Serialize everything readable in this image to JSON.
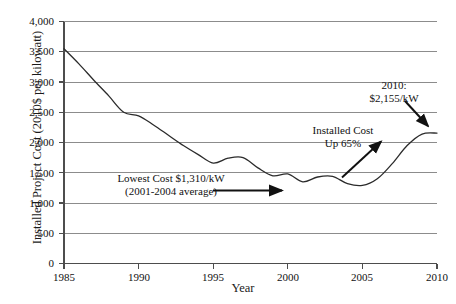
{
  "chart_data": {
    "type": "line",
    "title": "",
    "xlabel": "Year",
    "ylabel": "Installed Project Cost (2010$ per kilowatt)",
    "xlim": [
      1985,
      2010
    ],
    "ylim": [
      0,
      4000
    ],
    "grid": true,
    "legend": "none",
    "xticks": [
      "1985",
      "1990",
      "1995",
      "2000",
      "2005",
      "2010"
    ],
    "yticks": [
      "0",
      "500",
      "1,000",
      "1,500",
      "2,000",
      "2,500",
      "3,000",
      "3,500",
      "4,000"
    ],
    "x": [
      1985,
      1986,
      1987,
      1988,
      1989,
      1990,
      1991,
      1992,
      1993,
      1994,
      1995,
      1996,
      1997,
      1998,
      1999,
      2000,
      2001,
      2002,
      2003,
      2004,
      2005,
      2006,
      2007,
      2008,
      2009,
      2010
    ],
    "values": [
      3550,
      3300,
      3030,
      2770,
      2500,
      2440,
      2290,
      2120,
      1950,
      1800,
      1660,
      1740,
      1750,
      1580,
      1450,
      1480,
      1350,
      1430,
      1440,
      1320,
      1290,
      1400,
      1650,
      1950,
      2140,
      2155
    ],
    "series": [
      {
        "name": "Installed Project Cost",
        "values": [
          3550,
          3300,
          3030,
          2770,
          2500,
          2440,
          2290,
          2120,
          1950,
          1800,
          1660,
          1740,
          1750,
          1580,
          1450,
          1480,
          1350,
          1430,
          1440,
          1320,
          1290,
          1400,
          1650,
          1950,
          2140,
          2155
        ]
      }
    ],
    "annotations": [
      {
        "name": "lowest-cost",
        "line1": "Lowest Cost $1,310/kW",
        "line2": "(2001-2004 average)",
        "value": 1310,
        "period": "2001-2004"
      },
      {
        "name": "installed-cost-up",
        "line1": "Installed Cost",
        "line2": "Up 65%",
        "value": 65
      },
      {
        "name": "cost-2010",
        "line1": "2010:",
        "line2": "$2,155/kW",
        "value": 2155,
        "year": 2010
      }
    ]
  },
  "axes": {
    "y_title": "Installed Project Cost (2010$ per kilowatt)",
    "x_title": "Year",
    "y_tick_labels": [
      "4,000",
      "3,500",
      "3,000",
      "2,500",
      "2,000",
      "1,500",
      "1,000",
      "500",
      "0"
    ],
    "x_tick_labels": [
      "1985",
      "1990",
      "1995",
      "2000",
      "2005",
      "2010"
    ]
  },
  "annotations": {
    "lowest_cost_line1": "Lowest Cost $1,310/kW",
    "lowest_cost_line2": "(2001-2004 average)",
    "installed_cost_line1": "Installed Cost",
    "installed_cost_line2": "Up 65%",
    "cost_2010_line1": "2010:",
    "cost_2010_line2": "$2,155/kW"
  },
  "colors": {
    "line": "#2b2b2b",
    "grid": "#8c8c8c",
    "axis": "#5a5a5a",
    "text": "#111111",
    "background": "#ffffff"
  }
}
